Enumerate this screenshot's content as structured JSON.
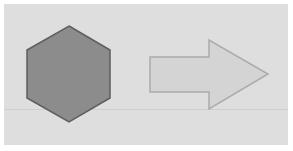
{
  "diagram": {
    "background_color": "#dedede",
    "shapes": [
      {
        "type": "hexagon",
        "fill": "#8c8c8c",
        "stroke": "#5e5e5e"
      },
      {
        "type": "right-arrow",
        "fill": "#d4d4d4",
        "stroke": "#ababab"
      }
    ]
  }
}
